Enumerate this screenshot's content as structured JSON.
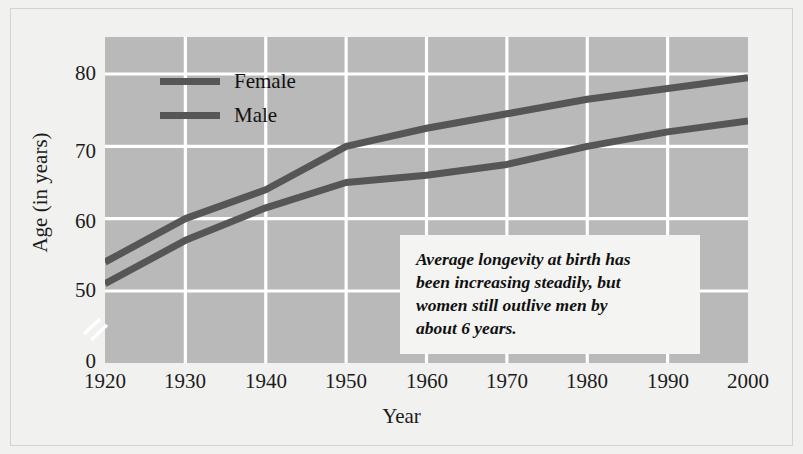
{
  "chart_data": {
    "type": "line",
    "title": "",
    "xlabel": "Year",
    "ylabel": "Age (in years)",
    "x": [
      1920,
      1930,
      1940,
      1950,
      1960,
      1970,
      1980,
      1990,
      2000
    ],
    "xtick_labels": [
      "1920",
      "1930",
      "1940",
      "1950",
      "1960",
      "1970",
      "1980",
      "1990",
      "2000"
    ],
    "ytick_labels": [
      "0",
      "50",
      "60",
      "70",
      "80"
    ],
    "ytick_values": [
      0,
      50,
      60,
      70,
      80
    ],
    "ylim": [
      50,
      85
    ],
    "xlim": [
      1920,
      2000
    ],
    "axis_break": true,
    "axis_break_symbol": "//",
    "grid": true,
    "grid_color": "#ffffff",
    "plot_background": "#b9b9b9",
    "legend_position": "top-left-inside",
    "series": [
      {
        "name": "Female",
        "color": "#565656",
        "values": [
          54,
          60,
          64,
          70,
          72.5,
          74.5,
          76.5,
          78,
          79.5
        ]
      },
      {
        "name": "Male",
        "color": "#565656",
        "values": [
          51,
          57,
          61.5,
          65,
          66,
          67.5,
          70,
          72,
          73.5
        ]
      }
    ],
    "annotations": [
      {
        "name": "summary-callout",
        "text": "Average longevity at birth has been increasing steadily, but women still outlive men by about 6 years."
      }
    ]
  },
  "legend": {
    "items": [
      {
        "label": "Female"
      },
      {
        "label": "Male"
      }
    ]
  },
  "axes": {
    "x_title": "Year",
    "y_title": "Age (in years)"
  },
  "callout": {
    "line1": "Average longevity at birth has",
    "line2": "been increasing steadily, but",
    "line3": "women still outlive men by",
    "line4": "about 6 years."
  },
  "colors": {
    "page_background": "#f1f1f0",
    "panel": "#b9b9b9",
    "gridline": "#ffffff",
    "series_line": "#565656",
    "text": "#1b1b1b",
    "callout_background": "#f4f4f2",
    "frame_border": "#d2d2d2"
  }
}
